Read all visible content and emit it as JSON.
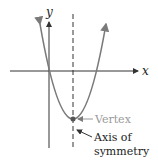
{
  "diagram": {
    "axes": {
      "x_label": "x",
      "y_label": "y"
    },
    "annotations": {
      "vertex_label": "Vertex",
      "axis_label_line1": "Axis of",
      "axis_label_line2": "symmetry"
    },
    "colors": {
      "curve": "#7a7a7a",
      "axes": "#333333",
      "vertex_label": "#9a9a9a",
      "axis_label": "#222222"
    }
  }
}
